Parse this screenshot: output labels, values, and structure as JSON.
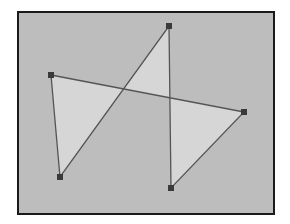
{
  "diagram": {
    "type": "self-intersecting-polygon",
    "fill_rule": "evenodd",
    "frame": {
      "x": 18,
      "y": 12,
      "width": 256,
      "height": 202
    },
    "colors": {
      "background": "#bdbdbd",
      "frame_border": "#1a1a1a",
      "polygon_fill": "#d6d6d6",
      "polygon_stroke": "#555555",
      "vertex": "#3a3a3a"
    },
    "vertices": [
      {
        "x": 51,
        "y": 75
      },
      {
        "x": 244,
        "y": 112
      },
      {
        "x": 171,
        "y": 188
      },
      {
        "x": 169,
        "y": 26
      },
      {
        "x": 60,
        "y": 177
      }
    ]
  }
}
